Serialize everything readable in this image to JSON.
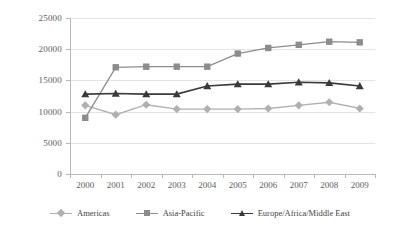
{
  "chart_data": {
    "type": "line",
    "title": "",
    "xlabel": "",
    "ylabel": "",
    "categories": [
      "2000",
      "2001",
      "2002",
      "2003",
      "2004",
      "2005",
      "2006",
      "2007",
      "2008",
      "2009"
    ],
    "yticks": [
      0,
      5000,
      10000,
      15000,
      20000,
      25000
    ],
    "ylim": [
      0,
      25000
    ],
    "grid": true,
    "legend_position": "bottom",
    "series": [
      {
        "name": "Americas",
        "marker": "diamond",
        "color": "#b0b0b0",
        "values": [
          11000,
          9500,
          11100,
          10400,
          10400,
          10400,
          10500,
          11000,
          11500,
          10500
        ]
      },
      {
        "name": "Asia-Pacific",
        "marker": "square",
        "color": "#8c8c8c",
        "values": [
          9000,
          17100,
          17200,
          17200,
          17200,
          19300,
          20200,
          20700,
          21200,
          21100
        ]
      },
      {
        "name": "Europe/Africa/Middle East",
        "marker": "triangle",
        "color": "#3a3a3a",
        "values": [
          12800,
          12900,
          12800,
          12800,
          14100,
          14400,
          14400,
          14700,
          14600,
          14100
        ]
      }
    ]
  },
  "axis": {
    "y_tick_labels": [
      "25000",
      "20000",
      "15000",
      "10000",
      "5000",
      "0"
    ],
    "x_tick_labels": [
      "2000",
      "2001",
      "2002",
      "2003",
      "2004",
      "2005",
      "2006",
      "2007",
      "2008",
      "2009"
    ]
  },
  "legend": {
    "items": [
      {
        "label": "Americas",
        "color": "#b0b0b0",
        "marker": "diamond"
      },
      {
        "label": "Asia-Pacific",
        "color": "#8c8c8c",
        "marker": "square"
      },
      {
        "label": "Europe/Africa/Middle East",
        "color": "#3a3a3a",
        "marker": "triangle"
      }
    ]
  },
  "colors": {
    "grid": "#e4e4e4",
    "axis": "#b9b9b9",
    "text": "#5d5d5d",
    "background": "#ffffff"
  }
}
